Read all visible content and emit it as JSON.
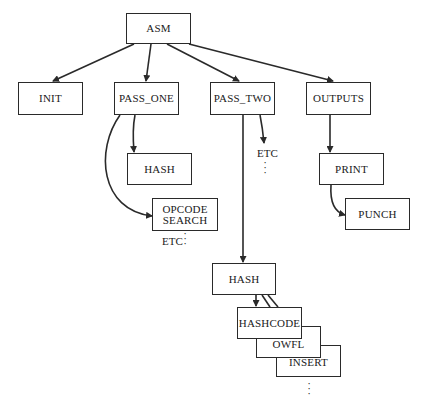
{
  "diagram": {
    "type": "module-hierarchy",
    "root": "ASM",
    "nodes": {
      "asm": "ASM",
      "init": "INIT",
      "pass_one": "PASS_ONE",
      "pass_two": "PASS_TWO",
      "outputs": "OUTPUTS",
      "hash_p1": "HASH",
      "opcode_search_line1": "OPCODE",
      "opcode_search_line2": "SEARCH",
      "print": "PRINT",
      "punch": "PUNCH",
      "hash_p2": "HASH",
      "hashcode": "HASHCODE",
      "owfl": "OWFL",
      "insert": "INSERT"
    },
    "annotations": {
      "etc_pass_two": "ETC",
      "etc_opcode": "ETC",
      "ellipsis": ":"
    },
    "edges": [
      {
        "from": "ASM",
        "to": "INIT"
      },
      {
        "from": "ASM",
        "to": "PASS_ONE"
      },
      {
        "from": "ASM",
        "to": "PASS_TWO"
      },
      {
        "from": "ASM",
        "to": "OUTPUTS"
      },
      {
        "from": "PASS_ONE",
        "to": "HASH"
      },
      {
        "from": "PASS_ONE",
        "to": "OPCODE SEARCH"
      },
      {
        "from": "PASS_TWO",
        "to": "ETC"
      },
      {
        "from": "PASS_TWO",
        "to": "HASH"
      },
      {
        "from": "OUTPUTS",
        "to": "PRINT"
      },
      {
        "from": "PRINT",
        "to": "PUNCH"
      },
      {
        "from": "HASH",
        "to": "HASHCODE"
      },
      {
        "from": "HASH",
        "to": "OWFL"
      },
      {
        "from": "HASH",
        "to": "INSERT"
      }
    ],
    "colors": {
      "line": "#2a2a2a",
      "background": "#ffffff"
    }
  }
}
